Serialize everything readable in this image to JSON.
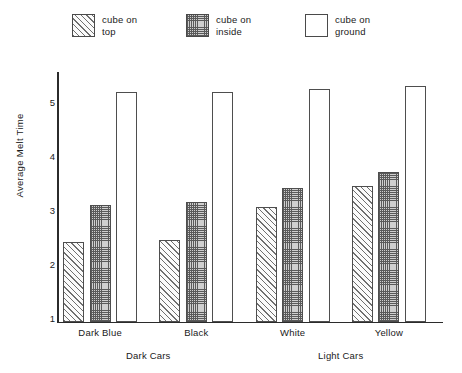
{
  "chart_data": {
    "type": "bar",
    "title": "",
    "xlabel": "",
    "ylabel": "Average Melt Time",
    "ylim": [
      0.93,
      5.6
    ],
    "yticks": [
      1,
      2,
      3,
      4,
      5
    ],
    "grid": false,
    "legend_position": "top",
    "categories": [
      "Dark Blue",
      "Black",
      "White",
      "Yellow"
    ],
    "group_labels": [
      {
        "label": "Dark Cars",
        "categories": [
          "Dark Blue",
          "Black"
        ]
      },
      {
        "label": "Light Cars",
        "categories": [
          "White",
          "Yellow"
        ]
      }
    ],
    "series": [
      {
        "name": "cube on\ntop",
        "pattern": "diagonal-hatch",
        "values": [
          2.4,
          2.45,
          3.05,
          3.45
        ]
      },
      {
        "name": "cube on\ninside",
        "pattern": "cross-hatch",
        "values": [
          3.1,
          3.15,
          3.4,
          3.7
        ]
      },
      {
        "name": "cube on\nground",
        "pattern": "empty",
        "values": [
          5.2,
          5.2,
          5.25,
          5.3
        ]
      }
    ]
  },
  "legend": {
    "items": [
      {
        "label": "cube on\ntop",
        "swatch": "hatch-swatch"
      },
      {
        "label": "cube on\ninside",
        "swatch": "cross-swatch"
      },
      {
        "label": "cube on\nground",
        "swatch": "empty-swatch"
      }
    ]
  }
}
